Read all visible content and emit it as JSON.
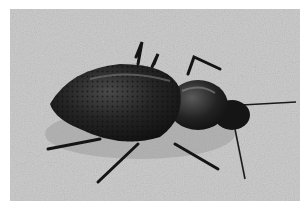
{
  "image": {
    "subject": "black ground beetle on sand",
    "style": "grayscale photograph",
    "colors": {
      "background_sand": "#c6c6c6",
      "beetle_body": "#1c1c1c",
      "highlight": "#6a6a6a",
      "border": "#ffffff"
    }
  }
}
